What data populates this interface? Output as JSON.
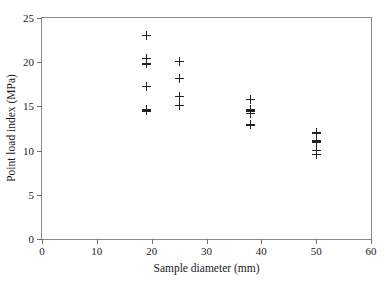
{
  "chart_data": {
    "type": "scatter",
    "title": "",
    "xlabel": "Sample diameter (mm)",
    "ylabel": "Point load index (MPa)",
    "xlim": [
      0,
      60
    ],
    "ylim": [
      0,
      25
    ],
    "xticks": [
      0,
      10,
      20,
      30,
      40,
      50,
      60
    ],
    "yticks": [
      0,
      5,
      10,
      15,
      20,
      25
    ],
    "xtick_labels": [
      "0",
      "10",
      "20",
      "30",
      "40",
      "50",
      "60"
    ],
    "ytick_labels": [
      "0",
      "5",
      "10",
      "15",
      "20",
      "25"
    ],
    "grid": false,
    "legend": null,
    "marker": "+",
    "marker_color": "#232323",
    "frame_color": "#8a8a8a",
    "background": "#ffffff",
    "series": [
      {
        "name": "Point load index",
        "points": [
          {
            "x": 19,
            "y": 23.0
          },
          {
            "x": 19,
            "y": 20.4
          },
          {
            "x": 19,
            "y": 19.8
          },
          {
            "x": 19,
            "y": 17.3
          },
          {
            "x": 19,
            "y": 14.7
          },
          {
            "x": 19,
            "y": 14.5
          },
          {
            "x": 25,
            "y": 20.1
          },
          {
            "x": 25,
            "y": 18.2
          },
          {
            "x": 25,
            "y": 16.1
          },
          {
            "x": 25,
            "y": 15.1
          },
          {
            "x": 38,
            "y": 15.8
          },
          {
            "x": 38,
            "y": 14.6
          },
          {
            "x": 38,
            "y": 14.4
          },
          {
            "x": 38,
            "y": 14.2
          },
          {
            "x": 38,
            "y": 12.9
          },
          {
            "x": 50,
            "y": 12.0
          },
          {
            "x": 50,
            "y": 11.1
          },
          {
            "x": 50,
            "y": 10.9
          },
          {
            "x": 50,
            "y": 10.0
          },
          {
            "x": 50,
            "y": 9.6
          }
        ]
      }
    ]
  }
}
